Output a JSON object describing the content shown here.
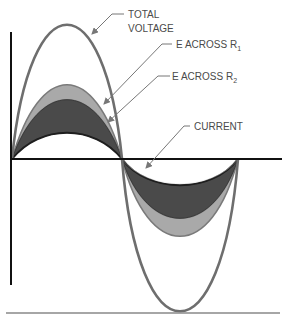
{
  "diagram": {
    "type": "waveform",
    "labels": {
      "total_voltage_line1": "TOTAL",
      "total_voltage_line2": "VOLTAGE",
      "e_r1_prefix": "E ACROSS R",
      "e_r1_sub": "1",
      "e_r2_prefix": "E ACROSS R",
      "e_r2_sub": "2",
      "current": "CURRENT"
    },
    "colors": {
      "total_voltage": "#6e6e6e",
      "e_r1_fill": "#a9a9a9",
      "e_r2_fill": "#4a4a4a",
      "current": "#1e1e1e",
      "axis": "#111111",
      "leader": "#777777"
    }
  }
}
